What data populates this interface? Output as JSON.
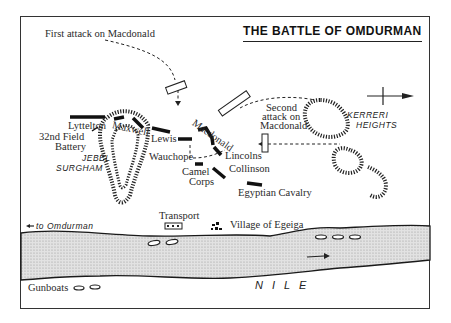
{
  "map": {
    "title": "THE BATTLE OF OMDURMAN",
    "colors": {
      "ink": "#222222",
      "river": "#d4d4d4",
      "paper": "#ffffff"
    },
    "annotations": {
      "first_attack": "First attack on Macdonald",
      "second_attack_line1": "Second",
      "second_attack_line2": "attack on",
      "second_attack_line3": "Macdonald",
      "to_omdurman": "to Omdurman"
    },
    "units": {
      "lyttelton": "Lyttelton",
      "field_battery_line1": "32nd Field",
      "field_battery_line2": "Battery",
      "maxwell": "Maxwell",
      "lewis": "Lewis",
      "macdonald": "Macdonald",
      "wauchope": "Wauchope",
      "lincolns": "Lincolns",
      "camel_corps_line1": "Camel",
      "camel_corps_line2": "Corps",
      "collinson": "Collinson",
      "egyptian_cavalry": "Egyptian Cavalry",
      "transport": "Transport",
      "gunboats": "Gunboats"
    },
    "places": {
      "jebel": "JEBEL",
      "surgham": "SURGHAM",
      "kerreri": "KERRERI",
      "heights": "HEIGHTS",
      "village": "Village of Egeiga",
      "river": "N I L E"
    },
    "north_arrow": "north-arrow-icon"
  }
}
